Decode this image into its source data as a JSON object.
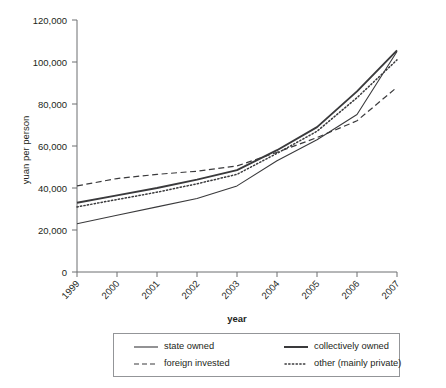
{
  "chart_data": {
    "type": "line",
    "title": "",
    "subtitle": "",
    "xlabel": "year",
    "ylabel": "yuan per person",
    "x": [
      1999,
      2000,
      2001,
      2002,
      2003,
      2004,
      2005,
      2006,
      2007
    ],
    "xtick_labels": [
      "1999",
      "2000",
      "2001",
      "2002",
      "2003",
      "2004",
      "2005",
      "2006",
      "2007"
    ],
    "ytick_labels": [
      "0",
      "20,000",
      "40,000",
      "60,000",
      "80,000",
      "100,000",
      "120,000"
    ],
    "ytick_values": [
      0,
      20000,
      40000,
      60000,
      80000,
      100000,
      120000
    ],
    "ylim": [
      0,
      120000
    ],
    "xlim": [
      1999,
      2007
    ],
    "grid": false,
    "legend_position": "bottom",
    "series": [
      {
        "name": "state owned",
        "style": "solid",
        "line_width": "thin",
        "color": "#3a3a3c",
        "values": [
          23000,
          27000,
          31000,
          35000,
          41000,
          53000,
          63000,
          75000,
          105000
        ]
      },
      {
        "name": "collectively owned",
        "style": "solid",
        "line_width": "thick",
        "color": "#3a3a3c",
        "values": [
          33000,
          36500,
          40000,
          44000,
          48500,
          58000,
          69000,
          86000,
          105500
        ]
      },
      {
        "name": "foreign invested",
        "style": "dashed",
        "line_width": "thin",
        "color": "#3a3a3c",
        "values": [
          41000,
          44500,
          46500,
          48000,
          50500,
          57000,
          64000,
          72000,
          88000
        ]
      },
      {
        "name": "other (mainly private)",
        "style": "dotted",
        "line_width": "medium",
        "color": "#3a3a3c",
        "values": [
          31000,
          34500,
          38000,
          42000,
          46500,
          56500,
          67000,
          83000,
          101000
        ]
      }
    ]
  },
  "legend": {
    "items": [
      {
        "label": "state owned",
        "style": "solid-thin"
      },
      {
        "label": "collectively owned",
        "style": "solid-thick"
      },
      {
        "label": "foreign invested",
        "style": "dashed"
      },
      {
        "label": "other (mainly private)",
        "style": "dotted"
      }
    ]
  }
}
